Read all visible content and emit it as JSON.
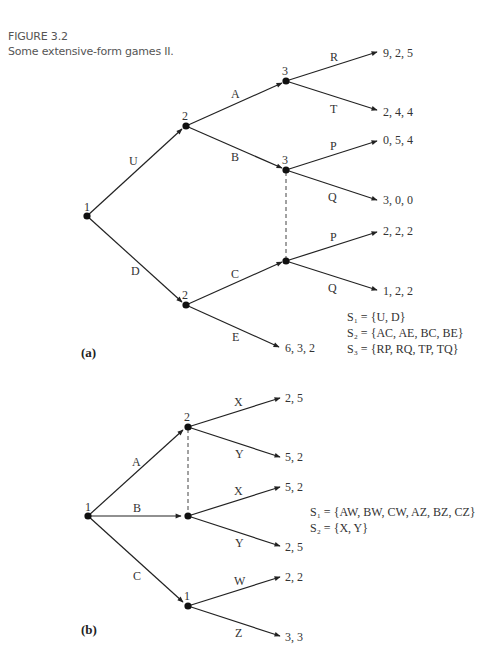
{
  "figure": {
    "number": "FIGURE 3.2",
    "title": "Some extensive-form games II."
  },
  "game_a": {
    "part_label": "(a)",
    "nodes": {
      "root": "1",
      "p2_upper": "2",
      "p3_top": "3",
      "p3_mid": "3",
      "p2_lower": "2"
    },
    "actions": {
      "U": "U",
      "D": "D",
      "A": "A",
      "B": "B",
      "C": "C",
      "E": "E",
      "R": "R",
      "T": "T",
      "P1": "P",
      "Q1": "Q",
      "P2": "P",
      "Q2": "Q"
    },
    "payoffs": {
      "R": "9, 2, 5",
      "T": "2, 4, 4",
      "P1": "0, 5, 4",
      "Q1": "3, 0, 0",
      "P2": "2, 2, 2",
      "Q2": "1, 2, 2",
      "E": "6, 3, 2"
    },
    "strategies": {
      "s1": "S₁ = {U, D}",
      "s2": "S₂ = {AC, AE, BC, BE}",
      "s3": "S₃ = {RP, RQ, TP, TQ}"
    }
  },
  "game_b": {
    "part_label": "(b)",
    "nodes": {
      "root": "1",
      "p2_top": "2",
      "p1_bottom": "1"
    },
    "actions": {
      "A": "A",
      "B": "B",
      "C": "C",
      "X1": "X",
      "Y1": "Y",
      "X2": "X",
      "Y2": "Y",
      "W": "W",
      "Z": "Z"
    },
    "payoffs": {
      "X1": "2, 5",
      "Y1": "5, 2",
      "X2": "5, 2",
      "Y2": "2, 5",
      "W": "2, 2",
      "Z": "3, 3"
    },
    "strategies": {
      "s1": "S₁ = {AW, BW, CW, AZ, BZ, CZ}",
      "s2": "S₂ = {X, Y}"
    }
  }
}
